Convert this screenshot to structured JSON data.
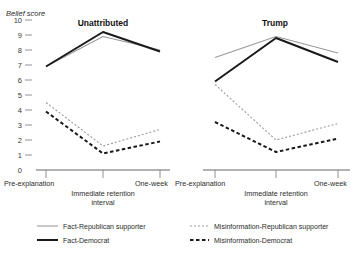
{
  "figure": {
    "y_axis_title": "Belief score",
    "y_ticks": [
      "10",
      "9",
      "8",
      "7",
      "6",
      "5",
      "4",
      "3",
      "2",
      "1",
      "0"
    ],
    "x_axis_label_line1": "Immediate retention",
    "x_axis_label_line2": "interval",
    "x_ticks": [
      "Pre-explanation",
      "One-week"
    ]
  },
  "legend": {
    "items": [
      {
        "label": "Fact-Republican supporter",
        "style": "solid",
        "color": "#9a9a9a",
        "width": 1.1
      },
      {
        "label": "Fact-Democrat",
        "style": "solid",
        "color": "#1a1a1a",
        "width": 2.0
      },
      {
        "label": "Misinformation-Republican supporter",
        "style": "dashed",
        "color": "#9a9a9a",
        "width": 1.1
      },
      {
        "label": "Misinformation-Democrat",
        "style": "dashed",
        "color": "#1a1a1a",
        "width": 2.0
      }
    ]
  },
  "chart_data": {
    "type": "line",
    "title": "",
    "xlabel": "Immediate retention interval",
    "ylabel": "Belief score",
    "ylim": [
      0,
      10
    ],
    "yticks": [
      0,
      1,
      2,
      3,
      4,
      5,
      6,
      7,
      8,
      9,
      10
    ],
    "grid": false,
    "legend_position": "bottom",
    "categories": [
      "Pre-explanation",
      "Immediate retention",
      "One-week"
    ],
    "panels": [
      {
        "title": "Unattributed",
        "series": [
          {
            "name": "Fact-Republican supporter",
            "values": [
              6.9,
              8.9,
              8.0
            ],
            "style": "solid",
            "color": "#9a9a9a"
          },
          {
            "name": "Fact-Democrat",
            "values": [
              6.9,
              9.2,
              7.9
            ],
            "style": "solid",
            "color": "#1a1a1a"
          },
          {
            "name": "Misinformation-Republican supporter",
            "values": [
              4.5,
              1.6,
              2.7
            ],
            "style": "dashed",
            "color": "#9a9a9a"
          },
          {
            "name": "Misinformation-Democrat",
            "values": [
              3.9,
              1.1,
              1.9
            ],
            "style": "dashed",
            "color": "#1a1a1a"
          }
        ]
      },
      {
        "title": "Trump",
        "series": [
          {
            "name": "Fact-Republican supporter",
            "values": [
              7.5,
              8.9,
              7.8
            ],
            "style": "solid",
            "color": "#9a9a9a"
          },
          {
            "name": "Fact-Democrat",
            "values": [
              5.9,
              8.8,
              7.2
            ],
            "style": "solid",
            "color": "#1a1a1a"
          },
          {
            "name": "Misinformation-Republican supporter",
            "values": [
              5.7,
              2.0,
              3.1
            ],
            "style": "dashed",
            "color": "#9a9a9a"
          },
          {
            "name": "Misinformation-Democrat",
            "values": [
              3.2,
              1.2,
              2.1
            ],
            "style": "dashed",
            "color": "#1a1a1a"
          }
        ]
      }
    ]
  }
}
